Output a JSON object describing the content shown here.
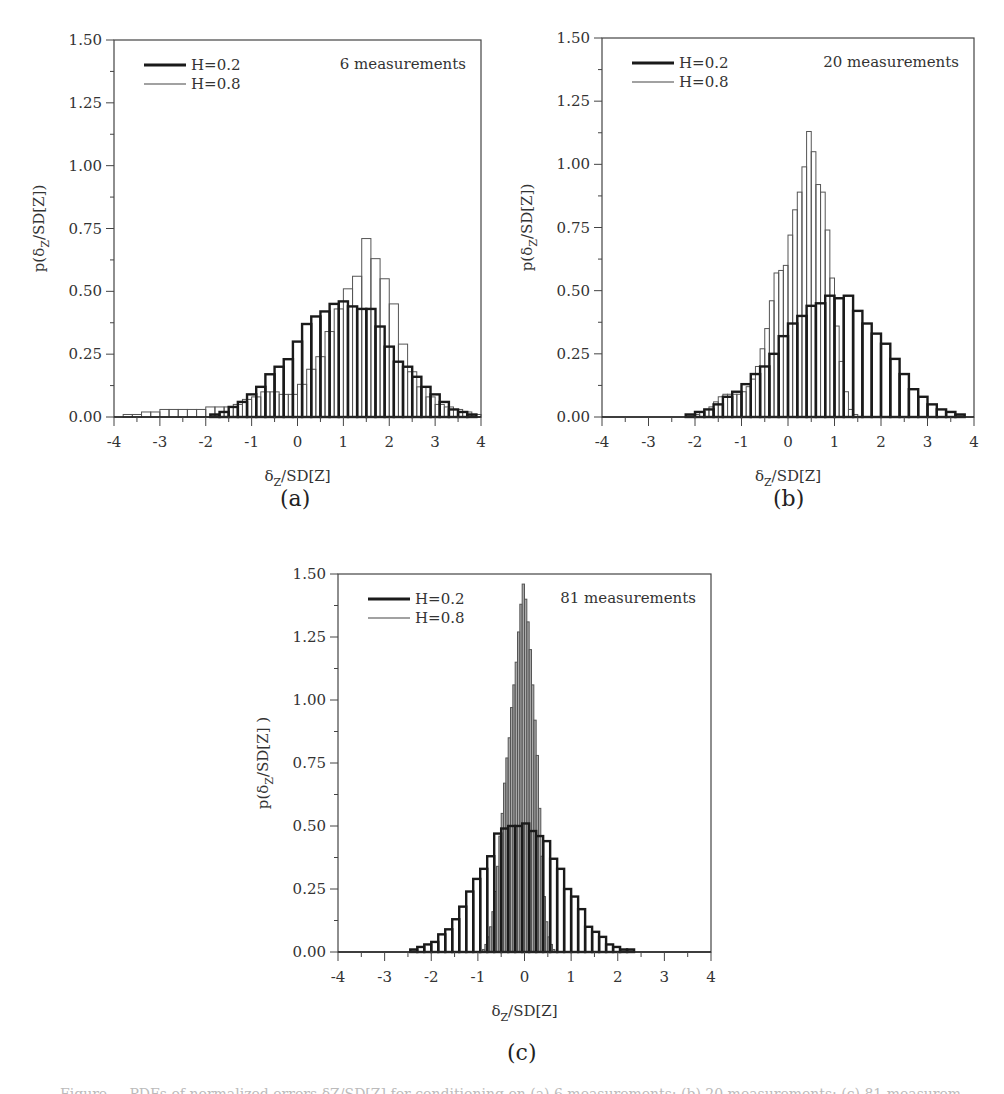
{
  "figure": {
    "caption_partial": "Figure ... PDFs of normalized errors δZ/SD[Z] for conditioning on (a) 6 measurements; (b) 20 measurements; (c) 81 measurements"
  },
  "chart_data": [
    {
      "id": "a",
      "type": "bar",
      "subtitle": "(a)",
      "annotation": "6 measurements",
      "xlabel": "δZ/SD[Z]",
      "ylabel": "p(δZ/SD[Z])",
      "xlim": [
        -4,
        4
      ],
      "ylim": [
        0,
        1.5
      ],
      "xticks": [
        -4,
        -3,
        -2,
        -1,
        0,
        1,
        2,
        3,
        4
      ],
      "yticks": [
        "0.00",
        "0.25",
        "0.50",
        "0.75",
        "1.00",
        "1.25",
        "1.50"
      ],
      "grid": false,
      "legend": [
        "H=0.2",
        "H=0.8"
      ],
      "legend_position": "upper left",
      "series": [
        {
          "name": "H=0.2",
          "style": "thick",
          "bin_width": 0.2,
          "bin_left": -3.9,
          "values": [
            0.0,
            0.0,
            0.0,
            0.0,
            0.0,
            0.0,
            0.0,
            0.0,
            0.0,
            0.0,
            0.01,
            0.02,
            0.04,
            0.06,
            0.09,
            0.12,
            0.17,
            0.2,
            0.23,
            0.3,
            0.37,
            0.4,
            0.42,
            0.45,
            0.46,
            0.44,
            0.43,
            0.43,
            0.36,
            0.28,
            0.22,
            0.2,
            0.16,
            0.12,
            0.09,
            0.06,
            0.03,
            0.02,
            0.01,
            0.0
          ]
        },
        {
          "name": "H=0.8",
          "style": "thin",
          "bin_width": 0.2,
          "bin_left": -3.8,
          "values": [
            0.01,
            0.01,
            0.02,
            0.02,
            0.03,
            0.03,
            0.03,
            0.03,
            0.03,
            0.04,
            0.04,
            0.04,
            0.05,
            0.07,
            0.08,
            0.1,
            0.1,
            0.09,
            0.09,
            0.13,
            0.19,
            0.24,
            0.34,
            0.43,
            0.51,
            0.56,
            0.71,
            0.63,
            0.55,
            0.45,
            0.29,
            0.18,
            0.12,
            0.08,
            0.05,
            0.04,
            0.03,
            0.02,
            0.01,
            0.0
          ]
        }
      ]
    },
    {
      "id": "b",
      "type": "bar",
      "subtitle": "(b)",
      "annotation": "20 measurements",
      "xlabel": "δZ/SD[Z]",
      "ylabel": "p(δZ/SD[Z])",
      "xlim": [
        -4,
        4
      ],
      "ylim": [
        0,
        1.5
      ],
      "xticks": [
        -4,
        -3,
        -2,
        -1,
        0,
        1,
        2,
        3,
        4
      ],
      "yticks": [
        "0.00",
        "0.25",
        "0.50",
        "0.75",
        "1.00",
        "1.25",
        "1.50"
      ],
      "grid": false,
      "legend": [
        "H=0.2",
        "H=0.8"
      ],
      "legend_position": "upper left",
      "series": [
        {
          "name": "H=0.2",
          "style": "thick",
          "bin_width": 0.2,
          "bin_left": -4.0,
          "values": [
            0.0,
            0.0,
            0.0,
            0.0,
            0.0,
            0.0,
            0.0,
            0.0,
            0.0,
            0.01,
            0.02,
            0.03,
            0.05,
            0.08,
            0.1,
            0.13,
            0.17,
            0.2,
            0.25,
            0.32,
            0.37,
            0.4,
            0.44,
            0.45,
            0.48,
            0.47,
            0.48,
            0.42,
            0.37,
            0.33,
            0.29,
            0.23,
            0.17,
            0.11,
            0.08,
            0.05,
            0.03,
            0.02,
            0.01,
            0.0
          ]
        },
        {
          "name": "H=0.8",
          "style": "thin",
          "bin_width": 0.1,
          "bin_left": -2.0,
          "values": [
            0.01,
            0.02,
            0.03,
            0.04,
            0.06,
            0.08,
            0.09,
            0.09,
            0.09,
            0.09,
            0.1,
            0.12,
            0.15,
            0.2,
            0.27,
            0.35,
            0.46,
            0.57,
            0.58,
            0.6,
            0.72,
            0.82,
            0.89,
            0.99,
            1.13,
            1.05,
            0.92,
            0.89,
            0.74,
            0.55,
            0.36,
            0.22,
            0.1,
            0.03,
            0.01,
            0.0
          ]
        }
      ]
    },
    {
      "id": "c",
      "type": "bar",
      "subtitle": "(c)",
      "annotation": "81 measurements",
      "xlabel": "δZ/SD[Z]",
      "ylabel": "p(δZ/SD[Z] )",
      "xlim": [
        -4,
        4
      ],
      "ylim": [
        0,
        1.5
      ],
      "xticks": [
        -4,
        -3,
        -2,
        -1,
        0,
        1,
        2,
        3,
        4
      ],
      "yticks": [
        "0.00",
        "0.25",
        "0.50",
        "0.75",
        "1.00",
        "1.25",
        "1.50"
      ],
      "grid": false,
      "legend": [
        "H=0.2",
        "H=0.8"
      ],
      "legend_position": "upper left",
      "series": [
        {
          "name": "H=0.2",
          "style": "thick",
          "bin_width": 0.15,
          "bin_left": -3.5,
          "values": [
            0.0,
            0.0,
            0.0,
            0.0,
            0.0,
            0.0,
            0.0,
            0.01,
            0.02,
            0.03,
            0.04,
            0.07,
            0.09,
            0.13,
            0.18,
            0.24,
            0.29,
            0.33,
            0.38,
            0.47,
            0.49,
            0.5,
            0.5,
            0.51,
            0.48,
            0.46,
            0.44,
            0.37,
            0.33,
            0.25,
            0.22,
            0.17,
            0.1,
            0.08,
            0.06,
            0.03,
            0.02,
            0.01,
            0.01,
            0.0,
            0.0,
            0.0,
            0.0,
            0.0,
            0.0
          ]
        },
        {
          "name": "H=0.8",
          "style": "thin-shaded",
          "bin_width": 0.05,
          "bin_left": -0.9,
          "values": [
            0.01,
            0.03,
            0.06,
            0.1,
            0.16,
            0.24,
            0.34,
            0.46,
            0.55,
            0.67,
            0.77,
            0.85,
            0.97,
            1.06,
            1.15,
            1.27,
            1.38,
            1.46,
            1.4,
            1.31,
            1.2,
            1.06,
            0.92,
            0.78,
            0.57,
            0.38,
            0.22,
            0.12,
            0.06,
            0.03,
            0.01,
            0.0
          ]
        }
      ]
    }
  ]
}
